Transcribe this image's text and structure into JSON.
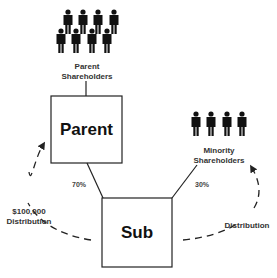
{
  "diagram": {
    "nodes": {
      "parent_shareholders": {
        "line1": "Parent",
        "line2": "Shareholders",
        "icon": "people-group-icon",
        "count": 8
      },
      "parent": {
        "label": "Parent"
      },
      "sub": {
        "label": "Sub"
      },
      "minority_shareholders": {
        "line1": "Minority",
        "line2": "Shareholders",
        "icon": "people-group-icon",
        "count": 4
      }
    },
    "edges": {
      "parent_to_sub_pct": "70%",
      "minority_to_sub_pct": "30%"
    },
    "flows": {
      "left": {
        "line1": "$100,000",
        "line2": "Distribution"
      },
      "right": {
        "line1": "Distribution"
      }
    },
    "colors": {
      "line": "#222222",
      "fill": "#111111",
      "background": "#ffffff"
    }
  }
}
